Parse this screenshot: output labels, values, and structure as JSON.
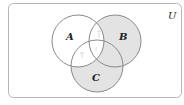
{
  "diagram": {
    "type": "venn-3",
    "universe": {
      "label": "U",
      "x": 8,
      "y": 3,
      "width": 174,
      "height": 95,
      "rx": 5
    },
    "sets": [
      {
        "label": "A",
        "cx": 78,
        "cy": 41,
        "r": 26,
        "label_x": 69,
        "label_y": 38
      },
      {
        "label": "B",
        "cx": 115,
        "cy": 41,
        "r": 26,
        "label_x": 119,
        "label_y": 38
      },
      {
        "label": "C",
        "cx": 97,
        "cy": 66,
        "r": 26,
        "label_x": 95,
        "label_y": 81
      }
    ],
    "shaded_region": "(B ∪ C) − A",
    "colors": {
      "shade": "#e3e3e3",
      "stroke": "#8a8a8a",
      "frame": "#b5b5b5",
      "background": "#ffffff"
    }
  }
}
